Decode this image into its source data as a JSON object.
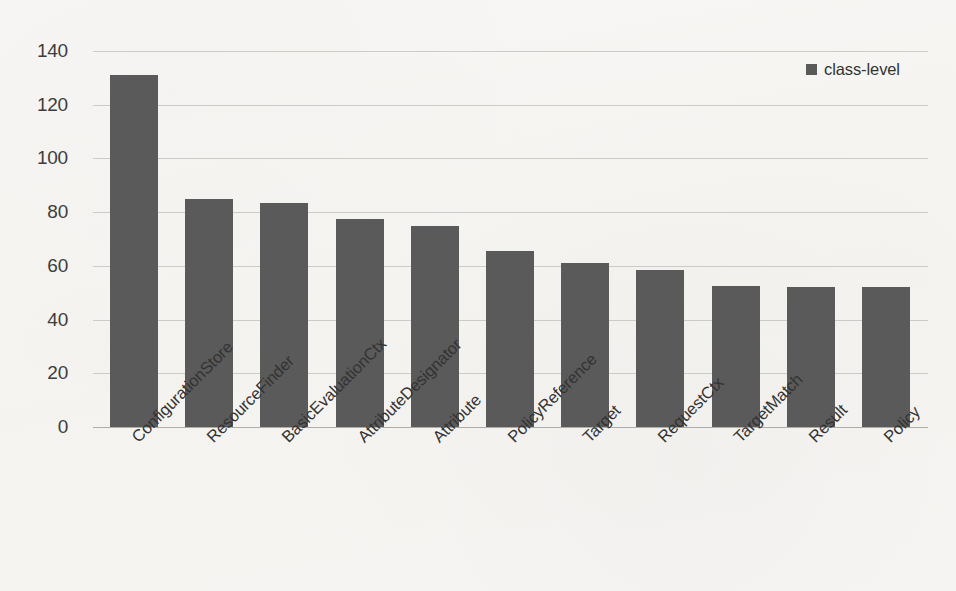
{
  "chart_data": {
    "type": "bar",
    "title": "",
    "xlabel": "",
    "ylabel": "",
    "ylim": [
      0,
      140
    ],
    "ytick_step": 20,
    "yticks": [
      "0",
      "20",
      "40",
      "60",
      "80",
      "100",
      "120",
      "140"
    ],
    "grid": true,
    "legend_position": "top-right",
    "legend": [
      "class-level"
    ],
    "categories": [
      "ConfigurationStore",
      "ResourceFinder",
      "BasicEvaluationCtx",
      "AttributeDesignator",
      "Attribute",
      "PolicyReference",
      "Target",
      "RequestCtx",
      "TargetMatch",
      "Result",
      "Policy"
    ],
    "series": [
      {
        "name": "class-level",
        "values": [
          131,
          85,
          83.5,
          77.5,
          75,
          65.5,
          61,
          58.5,
          52.5,
          52,
          52
        ]
      }
    ]
  },
  "style": {
    "bar_color": "#5a5a5a",
    "grid_color": "#c8c8c4",
    "axis_color": "#a9a9a5",
    "text_color": "#333333",
    "background": "#f6f5f2"
  }
}
